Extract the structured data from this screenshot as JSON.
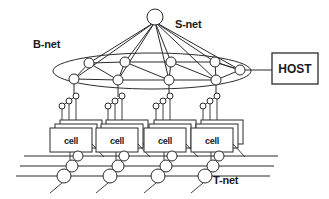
{
  "diagram": {
    "background_color": "#ffffff",
    "line_color": "#2b2b2b",
    "node_fill": "#ffffff",
    "labels": {
      "s_net": "S-net",
      "b_net": "B-net",
      "t_net": "T-net",
      "host": "HOST"
    },
    "cells": [
      {
        "label": "cell"
      },
      {
        "label": "cell"
      },
      {
        "label": "cell"
      },
      {
        "label": "cell"
      }
    ],
    "structure": {
      "s_net": {
        "kind": "star",
        "apex_node_count": 1,
        "radiating_link_count": 8
      },
      "b_net": {
        "kind": "ring-ellipse",
        "back_node_count": 4,
        "front_node_count": 4,
        "end_node_count": 1,
        "total_node_count": 9
      },
      "t_net": {
        "kind": "bus",
        "horizontal_line_count": 3,
        "switch_node_count_per_group": 3
      },
      "cell_group": {
        "group_count": 4,
        "stacked_box_count": 3,
        "interface_circle_count": 3
      },
      "host": {
        "kind": "box",
        "connected_to": "B-net"
      }
    }
  }
}
